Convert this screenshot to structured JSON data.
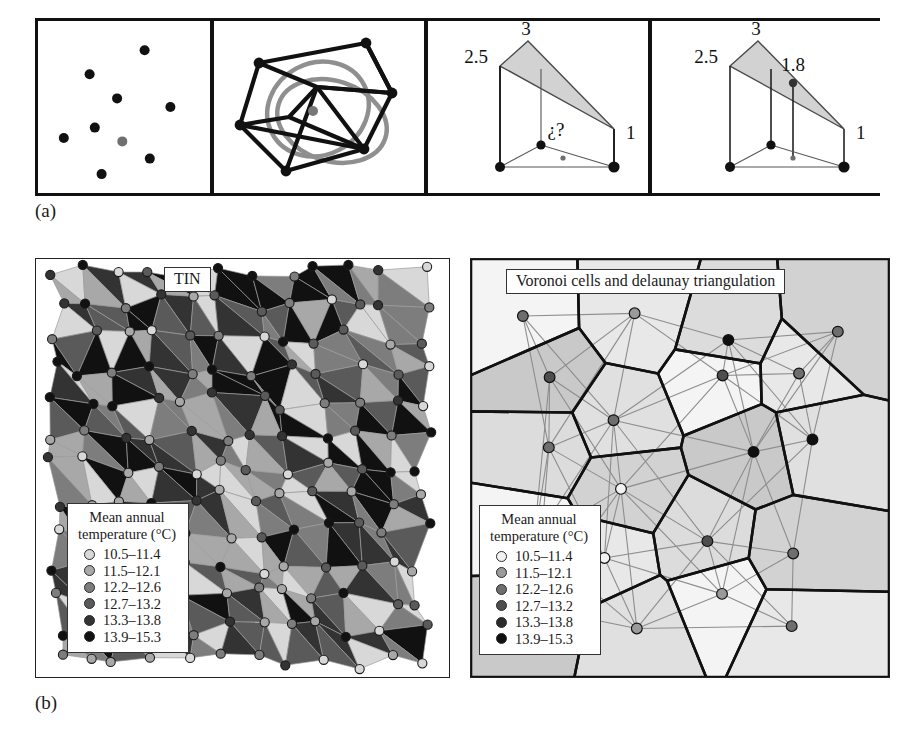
{
  "figure": {
    "part_a_label": "(a)",
    "part_b_label": "(b)"
  },
  "row_a": {
    "panels": [
      {
        "name": "scattered-sample-points",
        "caption": "",
        "points": [
          {
            "x": 0.62,
            "y": 0.17,
            "shade": "#111111"
          },
          {
            "x": 0.3,
            "y": 0.31,
            "shade": "#111111"
          },
          {
            "x": 0.46,
            "y": 0.45,
            "shade": "#111111"
          },
          {
            "x": 0.77,
            "y": 0.5,
            "shade": "#111111"
          },
          {
            "x": 0.33,
            "y": 0.62,
            "shade": "#111111"
          },
          {
            "x": 0.15,
            "y": 0.68,
            "shade": "#111111"
          },
          {
            "x": 0.49,
            "y": 0.7,
            "shade": "#6f6f6f"
          },
          {
            "x": 0.65,
            "y": 0.8,
            "shade": "#111111"
          },
          {
            "x": 0.37,
            "y": 0.89,
            "shade": "#111111"
          }
        ]
      },
      {
        "name": "delaunay-triangulation-with-circumcircle",
        "caption": "",
        "vertices": [
          {
            "x": 0.21,
            "y": 0.24
          },
          {
            "x": 0.74,
            "y": 0.12
          },
          {
            "x": 0.88,
            "y": 0.4
          },
          {
            "x": 0.49,
            "y": 0.38
          },
          {
            "x": 0.1,
            "y": 0.6
          },
          {
            "x": 0.36,
            "y": 0.55
          },
          {
            "x": 0.72,
            "y": 0.73
          },
          {
            "x": 0.34,
            "y": 0.87
          },
          {
            "x": 0.46,
            "y": 0.52
          }
        ],
        "center_point": {
          "x": 0.46,
          "y": 0.52,
          "shade": "#6f6f6f"
        }
      },
      {
        "name": "tin-facet-unknown-value",
        "vertex_labels": [
          "3",
          "2.5",
          "1"
        ],
        "query_label": "¿?"
      },
      {
        "name": "tin-facet-interpolated-value",
        "vertex_labels": [
          "3",
          "2.5",
          "1"
        ],
        "interpolated_label": "1.8"
      }
    ]
  },
  "row_b": {
    "tin_panel": {
      "title": "TIN",
      "legend": {
        "title_line1": "Mean annual",
        "title_line2": "temperature (°C)",
        "classes": [
          {
            "label": "10.5–11.4",
            "color": "#d8d8d8"
          },
          {
            "label": "11.5–12.1",
            "color": "#a8a8a8"
          },
          {
            "label": "12.2–12.6",
            "color": "#7d7d7d"
          },
          {
            "label": "12.7–13.2",
            "color": "#5a5a5a"
          },
          {
            "label": "13.3–13.8",
            "color": "#333333"
          },
          {
            "label": "13.9–15.3",
            "color": "#111111"
          }
        ]
      }
    },
    "voronoi_panel": {
      "title": "Voronoi cells and delaunay triangulation",
      "legend": {
        "title_line1": "Mean annual",
        "title_line2": "temperature (°C)",
        "classes": [
          {
            "label": "10.5–11.4",
            "color": "#f2f2f2"
          },
          {
            "label": "11.5–12.1",
            "color": "#9a9a9a"
          },
          {
            "label": "12.2–12.6",
            "color": "#6e6e6e"
          },
          {
            "label": "12.7–13.2",
            "color": "#4e4e4e"
          },
          {
            "label": "13.3–13.8",
            "color": "#2b2b2b"
          },
          {
            "label": "13.9–15.3",
            "color": "#0f0f0f"
          }
        ]
      }
    }
  },
  "chart_data": {
    "type": "scatter",
    "xlabel": "",
    "ylabel": "",
    "legend_position": "inside-bottom-left",
    "grid": false,
    "variable": "Mean annual temperature (°C)",
    "class_breaks": [
      {
        "label": "10.5–11.4",
        "min": 10.5,
        "max": 11.4
      },
      {
        "label": "11.5–12.1",
        "min": 11.5,
        "max": 12.1
      },
      {
        "label": "12.2–12.6",
        "min": 12.2,
        "max": 12.6
      },
      {
        "label": "12.7–13.2",
        "min": 12.7,
        "max": 13.2
      },
      {
        "label": "13.3–13.8",
        "min": 13.3,
        "max": 13.8
      },
      {
        "label": "13.9–15.3",
        "min": 13.9,
        "max": 15.3
      }
    ],
    "annotations": [
      "3",
      "2.5",
      "1",
      "¿?",
      "1.8",
      "TIN",
      "Voronoi cells and delaunay triangulation",
      "(a)",
      "(b)"
    ]
  }
}
